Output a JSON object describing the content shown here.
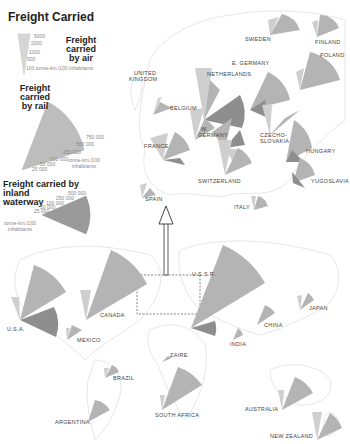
{
  "title": "Freight Carried",
  "legend": {
    "air": {
      "title_line1": "Freight carried",
      "title_line2": "by air",
      "ticks": [
        "5000",
        "2000",
        "1000",
        "500",
        "100 tonne-km./100 inhabitants"
      ]
    },
    "rail": {
      "title_line1": "Freight carried",
      "title_line2": "by rail",
      "ticks": [
        "750 000",
        "500 000",
        "250 000",
        "100 000",
        "50 000",
        "25 000"
      ],
      "unit_line1": "tonne-km./100",
      "unit_line2": "inhabitants"
    },
    "waterway": {
      "title_line1": "Freight carried by inland",
      "title_line2": "waterway",
      "ticks": [
        "500 000",
        "250 000",
        "100 000",
        "50 000",
        "25 000"
      ],
      "unit_line1": "tonne-km./100",
      "unit_line2": "inhabitants"
    }
  },
  "colors": {
    "air": "#cfcfcf",
    "rail": "#b4b4b4",
    "waterway": "#8e8e8e",
    "map_line": "#dcdcdc",
    "label": "#444444"
  },
  "europe_countries": [
    {
      "name": "SWEDEN"
    },
    {
      "name": "FINLAND"
    },
    {
      "name": "POLAND"
    },
    {
      "name": "E. GERMANY"
    },
    {
      "name": "UNITED"
    },
    {
      "name": "KINGDOM"
    },
    {
      "name": "NETHERLANDS"
    },
    {
      "name": "BELGIUM"
    },
    {
      "name": "W."
    },
    {
      "name": "GERMANY"
    },
    {
      "name": "CZECHO-"
    },
    {
      "name": "SLOVAKIA"
    },
    {
      "name": "FRANCE"
    },
    {
      "name": "HUNGARY"
    },
    {
      "name": "SWITZERLAND"
    },
    {
      "name": "YUGOSLAVIA"
    },
    {
      "name": "SPAIN"
    },
    {
      "name": "ITALY"
    }
  ],
  "world_countries": [
    {
      "name": "U.S.S.R."
    },
    {
      "name": "JAPAN"
    },
    {
      "name": "U.S.A."
    },
    {
      "name": "CANADA"
    },
    {
      "name": "CHINA"
    },
    {
      "name": "MEXICO"
    },
    {
      "name": "INDIA"
    },
    {
      "name": "ZAIRE"
    },
    {
      "name": "BRAZIL"
    },
    {
      "name": "SOUTH AFRICA"
    },
    {
      "name": "AUSTRALIA"
    },
    {
      "name": "ARGENTINA"
    },
    {
      "name": "NEW ZEALAND"
    }
  ]
}
